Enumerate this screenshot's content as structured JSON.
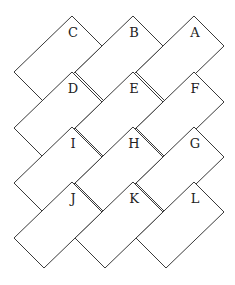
{
  "diagram": {
    "title": "",
    "stroke_color": "#3a3a3a",
    "background": "#ffffff",
    "tile_shape": {
      "short_side_offset": 30,
      "long_side_dx": 58,
      "long_side_dy": 56
    },
    "tiles": [
      {
        "label": "C",
        "row": 0,
        "col": 0,
        "top": [
          72,
          16
        ]
      },
      {
        "label": "B",
        "row": 0,
        "col": 1,
        "top": [
          133,
          16
        ]
      },
      {
        "label": "A",
        "row": 0,
        "col": 2,
        "top": [
          194,
          16
        ]
      },
      {
        "label": "D",
        "row": 1,
        "col": 0,
        "top": [
          72,
          72
        ]
      },
      {
        "label": "E",
        "row": 1,
        "col": 1,
        "top": [
          133,
          72
        ]
      },
      {
        "label": "F",
        "row": 1,
        "col": 2,
        "top": [
          194,
          72
        ]
      },
      {
        "label": "I",
        "row": 2,
        "col": 0,
        "top": [
          72,
          127
        ]
      },
      {
        "label": "H",
        "row": 2,
        "col": 1,
        "top": [
          133,
          127
        ]
      },
      {
        "label": "G",
        "row": 2,
        "col": 2,
        "top": [
          194,
          127
        ]
      },
      {
        "label": "J",
        "row": 3,
        "col": 0,
        "top": [
          72,
          182
        ]
      },
      {
        "label": "K",
        "row": 3,
        "col": 1,
        "top": [
          133,
          182
        ]
      },
      {
        "label": "L",
        "row": 3,
        "col": 2,
        "top": [
          194,
          182
        ]
      }
    ]
  }
}
